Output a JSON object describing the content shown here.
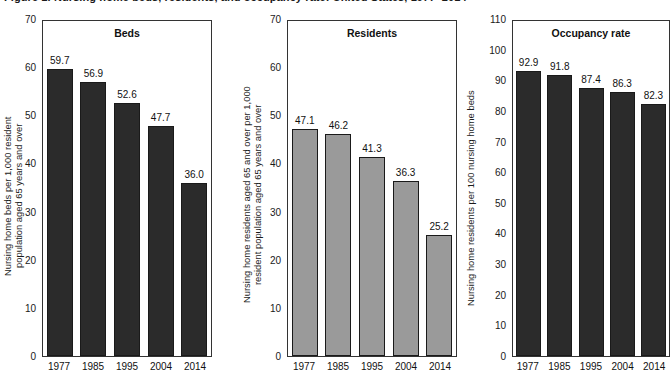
{
  "figure": {
    "cropped_title": "Figure 1. Nursing home beds, residents, and occupancy rate: United States, 1977–2014"
  },
  "chart_data": [
    {
      "type": "bar",
      "title": "Beds",
      "xlabel": "",
      "ylabel": "Nursing home beds per 1,000 resident\npopulation aged 65 years and over",
      "categories": [
        "1977",
        "1985",
        "1995",
        "2004",
        "2014"
      ],
      "values": [
        59.7,
        56.9,
        52.6,
        47.7,
        36.0
      ],
      "value_labels": [
        "59.7",
        "56.9",
        "52.6",
        "47.7",
        "36.0"
      ],
      "ylim": [
        0,
        70
      ],
      "yticks": [
        "70",
        "60",
        "50",
        "40",
        "30",
        "20",
        "10",
        "0"
      ],
      "ytick_values": [
        70,
        60,
        50,
        40,
        30,
        20,
        10,
        0
      ],
      "grid": false,
      "legend": "none",
      "bar_color": "#2b2b2b",
      "bar_edge_color": "#1a1a1a"
    },
    {
      "type": "bar",
      "title": "Residents",
      "xlabel": "",
      "ylabel": "Nursing home residents aged 65 and over per 1,000\nresident population aged 65 years and over",
      "categories": [
        "1977",
        "1985",
        "1995",
        "2004",
        "2014"
      ],
      "values": [
        47.1,
        46.2,
        41.3,
        36.3,
        25.2
      ],
      "value_labels": [
        "47.1",
        "46.2",
        "41.3",
        "36.3",
        "25.2"
      ],
      "ylim": [
        0,
        70
      ],
      "yticks": [
        "70",
        "60",
        "50",
        "40",
        "30",
        "20",
        "10",
        "0"
      ],
      "ytick_values": [
        70,
        60,
        50,
        40,
        30,
        20,
        10,
        0
      ],
      "grid": false,
      "legend": "none",
      "bar_color": "#9a9a9a",
      "bar_edge_color": "#1a1a1a"
    },
    {
      "type": "bar",
      "title": "Occupancy rate",
      "xlabel": "",
      "ylabel": "Nursing home residents per 100 nursing home beds",
      "categories": [
        "1977",
        "1985",
        "1995",
        "2004",
        "2014"
      ],
      "values": [
        92.9,
        91.8,
        87.4,
        86.3,
        82.3
      ],
      "value_labels": [
        "92.9",
        "91.8",
        "87.4",
        "86.3",
        "82.3"
      ],
      "ylim": [
        0,
        110
      ],
      "yticks": [
        "110",
        "100",
        "90",
        "80",
        "70",
        "60",
        "50",
        "40",
        "30",
        "20",
        "10",
        "0"
      ],
      "ytick_values": [
        110,
        100,
        90,
        80,
        70,
        60,
        50,
        40,
        30,
        20,
        10,
        0
      ],
      "grid": false,
      "legend": "none",
      "bar_color": "#2b2b2b",
      "bar_edge_color": "#1a1a1a"
    }
  ]
}
